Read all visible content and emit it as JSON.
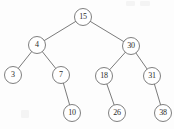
{
  "figure": {
    "kind": "binary-search-tree-diagram",
    "background_color": "#fdfdfd",
    "node_stroke_color": "#707070",
    "edge_stroke_color": "#6b6b6b",
    "label_color": "#2b2b2b",
    "node_radius": 8.5
  },
  "chart_data": {
    "type": "diagram",
    "title": "",
    "xlabel": "",
    "ylabel": "",
    "nodes": [
      {
        "id": "n15",
        "value": "15",
        "x": 83,
        "y": 17,
        "level": 0
      },
      {
        "id": "n4",
        "value": "4",
        "x": 37,
        "y": 45,
        "level": 1
      },
      {
        "id": "n30",
        "value": "30",
        "x": 131,
        "y": 46,
        "level": 1
      },
      {
        "id": "n3",
        "value": "3",
        "x": 13,
        "y": 75,
        "level": 2
      },
      {
        "id": "n7",
        "value": "7",
        "x": 61,
        "y": 75,
        "level": 2
      },
      {
        "id": "n18",
        "value": "18",
        "x": 104,
        "y": 76,
        "level": 2
      },
      {
        "id": "n31",
        "value": "31",
        "x": 152,
        "y": 76,
        "level": 2
      },
      {
        "id": "n10",
        "value": "10",
        "x": 72,
        "y": 113,
        "level": 3
      },
      {
        "id": "n26",
        "value": "26",
        "x": 117,
        "y": 113,
        "level": 3
      },
      {
        "id": "n38",
        "value": "38",
        "x": 163,
        "y": 113,
        "level": 3
      }
    ],
    "edges": [
      {
        "from": "n15",
        "to": "n4",
        "side": "left"
      },
      {
        "from": "n15",
        "to": "n30",
        "side": "right"
      },
      {
        "from": "n4",
        "to": "n3",
        "side": "left"
      },
      {
        "from": "n4",
        "to": "n7",
        "side": "right"
      },
      {
        "from": "n30",
        "to": "n18",
        "side": "left"
      },
      {
        "from": "n30",
        "to": "n31",
        "side": "right"
      },
      {
        "from": "n7",
        "to": "n10",
        "side": "right"
      },
      {
        "from": "n18",
        "to": "n26",
        "side": "right"
      },
      {
        "from": "n31",
        "to": "n38",
        "side": "right"
      }
    ]
  }
}
